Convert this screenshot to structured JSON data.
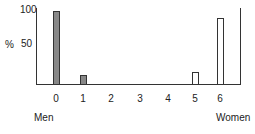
{
  "chart_data": {
    "type": "bar",
    "title": "",
    "xlabel": "",
    "ylabel": "%",
    "ylim": [
      0,
      100
    ],
    "yticks": [
      "100",
      "50"
    ],
    "categories": [
      "0",
      "1",
      "2",
      "3",
      "4",
      "5",
      "6"
    ],
    "series": [
      {
        "name": "Men",
        "fill": "#888888",
        "values": [
          100,
          12,
          0,
          0,
          0,
          0,
          0
        ]
      },
      {
        "name": "Women",
        "fill": "#ffffff",
        "values": [
          0,
          0,
          0,
          0,
          0,
          16,
          91
        ]
      }
    ],
    "annotations": {
      "left_end_label": "Men",
      "right_end_label": "Women"
    },
    "grid": false,
    "legend": "none"
  },
  "labels": {
    "y_axis_unit": "%",
    "y_tick_100": "100",
    "y_tick_50": "50",
    "x_ticks": [
      "0",
      "1",
      "2",
      "3",
      "4",
      "5",
      "6"
    ],
    "men": "Men",
    "women": "Women"
  },
  "colors": {
    "men_bar": "#888888",
    "women_bar": "#ffffff",
    "axis": "#333333"
  }
}
